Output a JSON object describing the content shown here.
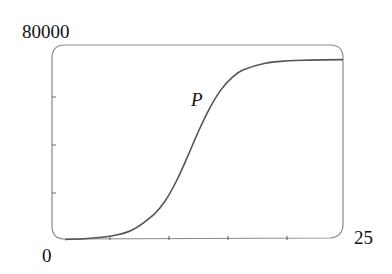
{
  "chart_data": {
    "type": "line",
    "title": "",
    "xlabel": "",
    "ylabel": "",
    "xlim": [
      0,
      25
    ],
    "ylim": [
      0,
      80000
    ],
    "x_tick_labels": [
      "0",
      "25"
    ],
    "y_tick_labels": [
      "80000"
    ],
    "x_ticks": [
      0,
      5,
      10,
      15,
      20,
      25
    ],
    "y_ticks": [
      0,
      20000,
      40000,
      60000,
      80000
    ],
    "grid": false,
    "legend": null,
    "annotations": [
      {
        "text": "P",
        "x": 11.3,
        "y": 58000
      }
    ],
    "series": [
      {
        "name": "P",
        "x": [
          0,
          2,
          4,
          6,
          8,
          9,
          10,
          11,
          12,
          13,
          14,
          15,
          16,
          18,
          20,
          22,
          25
        ],
        "values": [
          200,
          600,
          1500,
          4000,
          10500,
          16000,
          24000,
          34000,
          44500,
          54000,
          61500,
          66500,
          69700,
          72500,
          73500,
          73800,
          74000
        ]
      }
    ]
  },
  "labels": {
    "y_max": "80000",
    "x_min": "0",
    "x_max": "25",
    "series": "P"
  },
  "colors": {
    "curve": "#555555",
    "frame": "#8a8a8a",
    "text": "#111111"
  }
}
